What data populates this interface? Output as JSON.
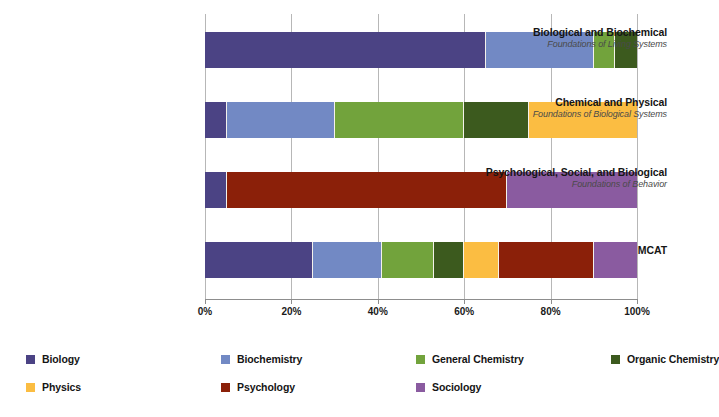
{
  "chart_data": {
    "type": "bar",
    "orientation": "horizontal",
    "stacked": true,
    "normalized": true,
    "title": "",
    "xlabel": "",
    "ylabel": "",
    "xlim": [
      0,
      100
    ],
    "grid": true,
    "legend_position": "bottom",
    "tick_labels": [
      "0%",
      "20%",
      "40%",
      "60%",
      "80%",
      "100%"
    ],
    "tick_values": [
      0,
      20,
      40,
      60,
      80,
      100
    ],
    "categories": [
      {
        "title": "Biological and Biochemical",
        "subtitle": "Foundations of Living Systems"
      },
      {
        "title": "Chemical and Physical",
        "subtitle": "Foundations of Biological Systems"
      },
      {
        "title": "Psychological, Social, and Biological",
        "subtitle": "Foundations of Behavior"
      },
      {
        "title": "MCAT",
        "subtitle": ""
      }
    ],
    "series": [
      {
        "name": "Biology",
        "color": "#4b4384",
        "values": [
          65,
          5,
          5,
          25
        ]
      },
      {
        "name": "Biochemistry",
        "color": "#7289c4",
        "values": [
          25,
          25,
          0,
          16
        ]
      },
      {
        "name": "General Chemistry",
        "color": "#72a33c",
        "values": [
          5,
          30,
          0,
          12
        ]
      },
      {
        "name": "Organic Chemistry",
        "color": "#3c5a1e",
        "values": [
          5,
          30,
          0,
          7
        ]
      },
      {
        "name": "Physics",
        "color": "#fbbd42",
        "values": [
          0,
          10,
          0,
          8
        ]
      },
      {
        "name": "Psychology",
        "color": "#8b2009",
        "values": [
          0,
          0,
          65,
          22
        ]
      },
      {
        "name": "Sociology",
        "color": "#8a5ba0",
        "values": [
          0,
          0,
          30,
          10
        ]
      }
    ],
    "bars": [
      {
        "category": "Biological and Biochemical",
        "segments": [
          {
            "series": "Biology",
            "color": "#4b4384",
            "value": 65
          },
          {
            "series": "Biochemistry",
            "color": "#7289c4",
            "value": 25
          },
          {
            "series": "General Chemistry",
            "color": "#72a33c",
            "value": 5
          },
          {
            "series": "Organic Chemistry",
            "color": "#3c5a1e",
            "value": 5
          }
        ]
      },
      {
        "category": "Chemical and Physical",
        "segments": [
          {
            "series": "Biology",
            "color": "#4b4384",
            "value": 5
          },
          {
            "series": "Biochemistry",
            "color": "#7289c4",
            "value": 25
          },
          {
            "series": "General Chemistry",
            "color": "#72a33c",
            "value": 30
          },
          {
            "series": "Organic Chemistry",
            "color": "#3c5a1e",
            "value": 15
          },
          {
            "series": "Physics",
            "color": "#fbbd42",
            "value": 25
          }
        ]
      },
      {
        "category": "Psychological, Social, and Biological",
        "segments": [
          {
            "series": "Biology",
            "color": "#4b4384",
            "value": 5
          },
          {
            "series": "Psychology",
            "color": "#8b2009",
            "value": 65
          },
          {
            "series": "Sociology",
            "color": "#8a5ba0",
            "value": 30
          }
        ]
      },
      {
        "category": "MCAT",
        "segments": [
          {
            "series": "Biology",
            "color": "#4b4384",
            "value": 25
          },
          {
            "series": "Biochemistry",
            "color": "#7289c4",
            "value": 16
          },
          {
            "series": "General Chemistry",
            "color": "#72a33c",
            "value": 12
          },
          {
            "series": "Organic Chemistry",
            "color": "#3c5a1e",
            "value": 7
          },
          {
            "series": "Physics",
            "color": "#fbbd42",
            "value": 8
          },
          {
            "series": "Psychology",
            "color": "#8b2009",
            "value": 22
          },
          {
            "series": "Sociology",
            "color": "#8a5ba0",
            "value": 10
          }
        ]
      }
    ],
    "legend": [
      {
        "label": "Biology",
        "color": "#4b4384"
      },
      {
        "label": "Biochemistry",
        "color": "#7289c4"
      },
      {
        "label": "General Chemistry",
        "color": "#72a33c"
      },
      {
        "label": "Organic Chemistry",
        "color": "#3c5a1e"
      },
      {
        "label": "Physics",
        "color": "#fbbd42"
      },
      {
        "label": "Psychology",
        "color": "#8b2009"
      },
      {
        "label": "Sociology",
        "color": "#8a5ba0"
      }
    ]
  }
}
